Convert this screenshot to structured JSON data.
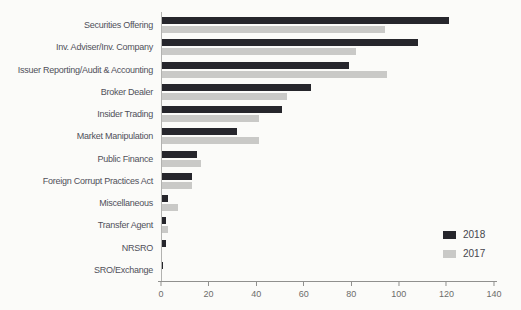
{
  "figure": {
    "background": "#fbfbf9"
  },
  "chart_data": {
    "type": "bar",
    "orientation": "horizontal",
    "title": "",
    "xlabel": "",
    "ylabel": "",
    "xlim": [
      0,
      140
    ],
    "xticks": [
      0,
      20,
      40,
      60,
      80,
      100,
      120,
      140
    ],
    "grid": false,
    "legend_position": "inside-right-bottom",
    "categories": [
      "Securities Offering",
      "Inv. Adviser/Inv. Company",
      "Issuer Reporting/Audit & Accounting",
      "Broker Dealer",
      "Insider Trading",
      "Market Manipulation",
      "Public Finance",
      "Foreign Corrupt Practices Act",
      "Miscellaneous",
      "Transfer Agent",
      "NRSRO",
      "SRO/Exchange"
    ],
    "series": [
      {
        "name": "2018",
        "color": "#26262c",
        "values": [
          121,
          108,
          79,
          63,
          51,
          32,
          15,
          13,
          3,
          2,
          2,
          1
        ]
      },
      {
        "name": "2017",
        "color": "#c9c9c7",
        "values": [
          94,
          82,
          95,
          53,
          41,
          41,
          17,
          13,
          7,
          3,
          0,
          0
        ]
      }
    ],
    "colors": {
      "axis": "#90908e",
      "tick_label": "#6d6d6b",
      "category_label": "#50505a"
    }
  }
}
